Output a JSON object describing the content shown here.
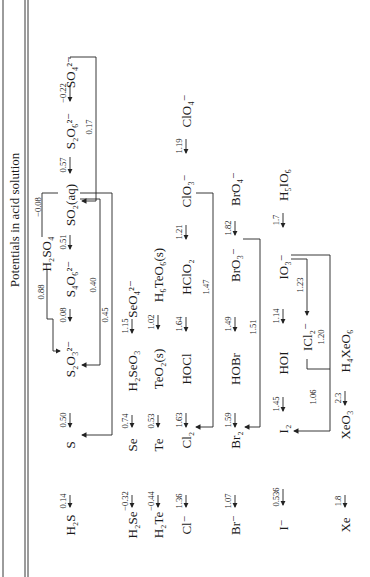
{
  "title": "Potentials in acid solution",
  "rows": {
    "sulfur": {
      "species": [
        "H2S",
        "S",
        "S2O3 2-",
        "S4O6 2-",
        "SO2(aq)",
        "S2O6 2-",
        "SO4 2-"
      ],
      "potentials": [
        "0.14",
        "0.50",
        "0.08",
        "0.51",
        "0.57",
        "−0.22"
      ],
      "side_species": "H2SO4",
      "brackets": [
        {
          "from": "H2SO4",
          "to": "S2O3 2-",
          "value": "0.88"
        },
        {
          "from": "SO2(aq)",
          "to": "H2SO4",
          "value": "−0.08"
        },
        {
          "from": "SO2(aq)",
          "to": "S2O3 2-",
          "value": "0.40"
        },
        {
          "from": "SO2(aq)",
          "to": "S",
          "value": "0.45"
        },
        {
          "from": "SO4 2-",
          "to": "SO2(aq)",
          "value": "0.17"
        }
      ]
    },
    "selenium": {
      "species": [
        "H2Se",
        "Se",
        "H2SeO3",
        "SeO4 2-"
      ],
      "potentials": [
        "−0.32",
        "0.74",
        "1.15"
      ]
    },
    "tellurium": {
      "species": [
        "H2Te",
        "Te",
        "TeO2(s)",
        "H6TeO6(s)"
      ],
      "potentials": [
        "−0.44",
        "0.53",
        "1.02"
      ]
    },
    "chlorine": {
      "species": [
        "Cl−",
        "Cl2",
        "HOCl",
        "HClO2",
        "ClO3−",
        "ClO4−"
      ],
      "potentials": [
        "1.36",
        "1.63",
        "1.64",
        "1.21",
        "1.19"
      ],
      "brackets": [
        {
          "from": "ClO3−",
          "to": "Cl2",
          "value": "1.47"
        }
      ]
    },
    "bromine": {
      "species": [
        "Br−",
        "Br2",
        "HOBr",
        "BrO3−",
        "BrO4−"
      ],
      "potentials": [
        "1.07",
        "1.59",
        "1.49",
        "1.82"
      ],
      "brackets": [
        {
          "from": "BrO3−",
          "to": "Br2",
          "value": "1.51"
        }
      ]
    },
    "iodine": {
      "species": [
        "I−",
        "I2",
        "HOI",
        "IO3−",
        "H5IO6"
      ],
      "potentials": [
        "0.536",
        "1.45",
        "1.14",
        "1.7"
      ],
      "side_species": "ICl2−",
      "brackets": [
        {
          "from": "IO3−",
          "to": "ICl2−",
          "value": "1.23"
        },
        {
          "from": "ICl2−",
          "to": "I2",
          "value": "1.06"
        },
        {
          "from": "IO3−",
          "to": "I2",
          "value": "1.20"
        }
      ]
    },
    "xenon": {
      "species": [
        "Xe",
        "XeO3",
        "H4XeO6"
      ],
      "potentials": [
        "1.8",
        "2.3"
      ]
    }
  },
  "labels": {
    "h2s": "H₂S",
    "s": "S",
    "s2o3": "S₂O₃²⁻",
    "s4o6": "S₄O₆²⁻",
    "so2": "SO₂(aq)",
    "s2o6": "S₂O₆²⁻",
    "so4": "SO₄²⁻",
    "h2so4": "H₂SO₄",
    "h2se": "H₂Se",
    "se": "Se",
    "h2seo3": "H₂SeO₃",
    "seo4": "SeO₄²⁻",
    "h2te": "H₂Te",
    "te": "Te",
    "teo2": "TeO₂(s)",
    "h6teo6": "H₆TeO₆(s)",
    "cl": "Cl⁻",
    "cl2": "Cl₂",
    "hocl": "HOCl",
    "hclo2": "HClO₂",
    "clo3": "ClO₃⁻",
    "clo4": "ClO₄⁻",
    "br": "Br⁻",
    "br2": "Br₂",
    "hobr": "HOBr",
    "bro3": "BrO₃⁻",
    "bro4": "BrO₄⁻",
    "i": "I⁻",
    "i2": "I₂",
    "hoi": "HOI",
    "io3": "IO₃⁻",
    "h5io6": "H₅IO₆",
    "icl2": "ICl₂⁻",
    "xe": "Xe",
    "xeo3": "XeO₃",
    "h4xeo6": "H₄XeO₆"
  },
  "pots": {
    "s1": "0.14",
    "s2": "0.50",
    "s3": "0.08",
    "s4": "0.51",
    "s5": "0.57",
    "s6": "−0.22",
    "sb1": "0.88",
    "sb2": "−0.08",
    "sb3": "0.40",
    "sb4": "0.45",
    "sb5": "0.17",
    "se1": "−0.32",
    "se2": "0.74",
    "se3": "1.15",
    "te1": "−0.44",
    "te2": "0.53",
    "te3": "1.02",
    "cl1": "1.36",
    "cl2": "1.63",
    "cl3": "1.64",
    "cl4": "1.21",
    "cl5": "1.19",
    "clb": "1.47",
    "br1": "1.07",
    "br2": "1.59",
    "br3": "1.49",
    "br4": "1.82",
    "brb": "1.51",
    "i1": "0.536",
    "i2": "1.45",
    "i3": "1.14",
    "i4": "1.7",
    "ib1": "1.23",
    "ib2": "1.06",
    "ib3": "1.20",
    "xe1": "1.8",
    "xe2": "2.3"
  }
}
